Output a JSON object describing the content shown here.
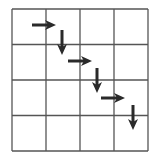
{
  "diagram": {
    "type": "grid-path",
    "rows": 4,
    "cols": 4,
    "grid": {
      "x": 12,
      "y": 9,
      "width": 136,
      "height": 142,
      "line_color": "#555555"
    },
    "arrow_color": "#2a2a2a",
    "arrows": [
      {
        "direction": "right",
        "x1": 32,
        "y1": 25,
        "x2": 56,
        "y2": 25
      },
      {
        "direction": "down",
        "x1": 62,
        "y1": 30,
        "x2": 62,
        "y2": 55
      },
      {
        "direction": "right",
        "x1": 68,
        "y1": 61,
        "x2": 92,
        "y2": 61
      },
      {
        "direction": "down",
        "x1": 97,
        "y1": 68,
        "x2": 97,
        "y2": 93
      },
      {
        "direction": "right",
        "x1": 101,
        "y1": 98,
        "x2": 125,
        "y2": 98
      },
      {
        "direction": "down",
        "x1": 133,
        "y1": 105,
        "x2": 133,
        "y2": 130
      }
    ]
  }
}
